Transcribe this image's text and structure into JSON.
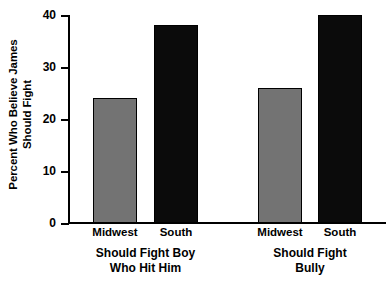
{
  "chart_data": {
    "type": "bar",
    "title": "",
    "xlabel": "",
    "ylabel_line1": "Percent Who Believe James",
    "ylabel_line2": "Should Fight",
    "ylim": [
      0,
      40
    ],
    "yticks": [
      0,
      10,
      20,
      30,
      40
    ],
    "ytick_labels": [
      "0",
      "10",
      "20",
      "30",
      "40"
    ],
    "grid": false,
    "legend": "none",
    "categories": [
      "Midwest",
      "South"
    ],
    "groups": [
      {
        "label_line1": "Should Fight Boy",
        "label_line2": "Who Hit Him",
        "bars": [
          {
            "category": "Midwest",
            "value": 24,
            "color": "#737373"
          },
          {
            "category": "South",
            "value": 38,
            "color": "#0b0b0b"
          }
        ]
      },
      {
        "label_line1": "Should Fight",
        "label_line2": "Bully",
        "bars": [
          {
            "category": "Midwest",
            "value": 26,
            "color": "#737373"
          },
          {
            "category": "South",
            "value": 40,
            "color": "#0b0b0b"
          }
        ]
      }
    ],
    "series": [
      {
        "name": "Midwest",
        "values": [
          24,
          26
        ],
        "color": "#737373"
      },
      {
        "name": "South",
        "values": [
          38,
          40
        ],
        "color": "#0b0b0b"
      }
    ],
    "x": [
      "Should Fight Boy Who Hit Him",
      "Should Fight Bully"
    ],
    "colors": {
      "midwest_bar": "#737373",
      "south_bar": "#0b0b0b",
      "axis": "#000000",
      "background": "#ffffff"
    }
  }
}
